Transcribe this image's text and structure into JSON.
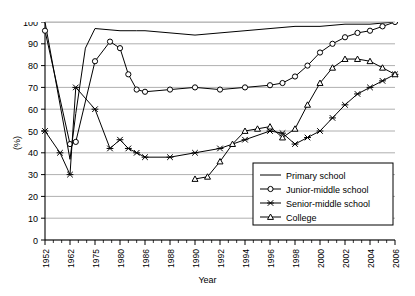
{
  "chart_data": {
    "type": "line",
    "title": "",
    "xlabel": "Year",
    "ylabel": "(%)",
    "ylim": [
      0,
      100
    ],
    "ytick_step": 10,
    "yticks": [
      0,
      10,
      20,
      30,
      40,
      50,
      60,
      70,
      80,
      90,
      100
    ],
    "grid": "horizontal",
    "legend_position": "inside-bottom-right",
    "xtick_labels": [
      "1952",
      "1962",
      "1975",
      "1980",
      "1986",
      "1988",
      "1990",
      "1992",
      "1994",
      "1996",
      "1998",
      "2000",
      "2002",
      "2004",
      "2006"
    ],
    "x": [
      1952,
      1954,
      1956,
      1958,
      1960,
      1962,
      1965,
      1970,
      1975,
      1978,
      1980,
      1982,
      1984,
      1986,
      1987,
      1988,
      1989,
      1990,
      1991,
      1992,
      1993,
      1994,
      1995,
      1996,
      1997,
      1998,
      1999,
      2000,
      2001,
      2002,
      2003,
      2004,
      2005,
      2006
    ],
    "series": [
      {
        "name": "Primary school",
        "marker": "none",
        "x": [
          1952,
          1962,
          1965,
          1970,
          1975,
          1980,
          1984,
          1986,
          1988,
          1990,
          1992,
          1994,
          1996,
          1998,
          2000,
          2002,
          2004,
          2006
        ],
        "values": [
          100,
          37,
          58,
          88,
          97,
          96,
          96,
          96,
          95,
          94,
          95,
          96,
          97,
          98,
          98,
          99,
          99,
          100
        ]
      },
      {
        "name": "Junior-middle school",
        "marker": "circle",
        "x": [
          1952,
          1962,
          1965,
          1975,
          1978,
          1980,
          1982,
          1984,
          1986,
          1988,
          1990,
          1992,
          1994,
          1996,
          1997,
          1998,
          1999,
          2000,
          2001,
          2002,
          2003,
          2004,
          2005,
          2006
        ],
        "values": [
          96,
          44,
          45,
          82,
          91,
          88,
          76,
          69,
          68,
          69,
          70,
          69,
          70,
          71,
          72,
          75,
          80,
          86,
          90,
          93,
          95,
          96,
          98,
          100
        ]
      },
      {
        "name": "Senior-middle school",
        "marker": "x",
        "x": [
          1952,
          1958,
          1962,
          1965,
          1975,
          1978,
          1980,
          1982,
          1984,
          1986,
          1988,
          1990,
          1992,
          1994,
          1996,
          1997,
          1998,
          1999,
          2000,
          2001,
          2002,
          2003,
          2004,
          2005,
          2006
        ],
        "values": [
          50,
          40,
          30,
          70,
          60,
          42,
          46,
          42,
          40,
          38,
          38,
          40,
          42,
          46,
          50,
          49,
          44,
          47,
          50,
          56,
          62,
          67,
          70,
          73,
          76
        ]
      },
      {
        "name": "College",
        "marker": "triangle",
        "x": [
          1990,
          1991,
          1992,
          1993,
          1994,
          1995,
          1996,
          1997,
          1998,
          1999,
          2000,
          2001,
          2002,
          2003,
          2004,
          2005,
          2006
        ],
        "values": [
          28,
          29,
          36,
          44,
          50,
          51,
          52,
          47,
          51,
          62,
          72,
          79,
          83,
          83,
          82,
          79,
          76
        ]
      }
    ],
    "legend": [
      {
        "label": "Primary school",
        "marker": "none"
      },
      {
        "label": "Junior-middle school",
        "marker": "circle"
      },
      {
        "label": "Senior-middle school",
        "marker": "x"
      },
      {
        "label": "College",
        "marker": "triangle"
      }
    ]
  }
}
